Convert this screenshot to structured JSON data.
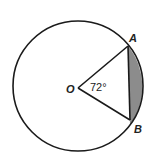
{
  "diagram": {
    "type": "circle-sector-segment",
    "center_label": "O",
    "point_a_label": "A",
    "point_b_label": "B",
    "angle_label": "72°",
    "shaded_region": "circular segment between chord AB and arc AB",
    "colors": {
      "stroke": "#1a1a1a",
      "shade": "#8c8c8c",
      "background": "#ffffff"
    }
  }
}
